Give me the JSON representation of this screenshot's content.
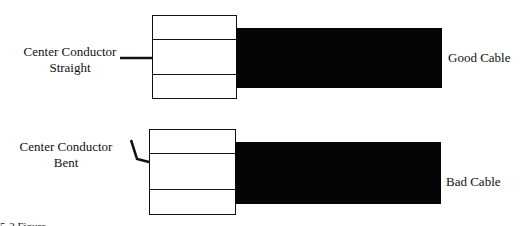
{
  "diagram": {
    "good": {
      "pin_label_line1": "Center Conductor",
      "pin_label_line2": "Straight",
      "cable_label": "Good Cable"
    },
    "bad": {
      "pin_label_line1": "Center Conductor",
      "pin_label_line2": "Bent",
      "cable_label": "Bad Cable"
    },
    "caption": "5-2  Figure",
    "colors": {
      "cable": "#050505",
      "outline": "#111111",
      "background": "#ffffff"
    }
  }
}
